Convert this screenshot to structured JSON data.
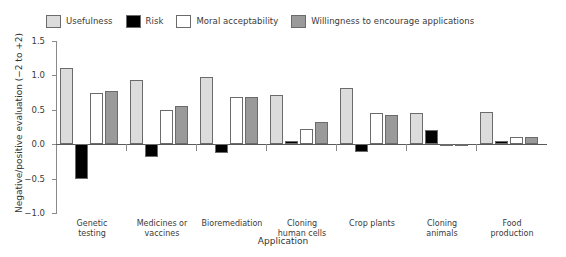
{
  "chart_data": {
    "type": "bar",
    "title": "",
    "xlabel": "Application",
    "ylabel": "Negative/positive evaluation (−2 to +2)",
    "ylim": [
      -1.0,
      1.5
    ],
    "yticks": [
      "1.5",
      "1.0",
      "0.5",
      "0.0",
      "−0.5",
      "−1.0"
    ],
    "ytick_values": [
      1.5,
      1.0,
      0.5,
      0.0,
      -0.5,
      -1.0
    ],
    "grid": false,
    "legend_position": "top",
    "categories": [
      "Genetic\ntesting",
      "Medicines or\nvaccines",
      "Bioremediation",
      "Cloning\nhuman cells",
      "Crop plants",
      "Cloning\nanimals",
      "Food\nproduction"
    ],
    "series": [
      {
        "name": "Usefulness",
        "color": "#dcdcdc",
        "values": [
          1.11,
          0.93,
          0.97,
          0.72,
          0.82,
          0.45,
          0.47
        ]
      },
      {
        "name": "Risk",
        "color": "#000000",
        "values": [
          -0.5,
          -0.19,
          -0.13,
          0.05,
          -0.11,
          0.21,
          0.04
        ]
      },
      {
        "name": "Moral acceptability",
        "color": "#ffffff",
        "values": [
          0.74,
          0.49,
          0.68,
          0.22,
          0.45,
          -0.02,
          0.1
        ]
      },
      {
        "name": "Willingness to encourage applications",
        "color": "#9a9a9a",
        "values": [
          0.78,
          0.55,
          0.68,
          0.32,
          0.43,
          -0.01,
          0.11
        ]
      }
    ]
  }
}
